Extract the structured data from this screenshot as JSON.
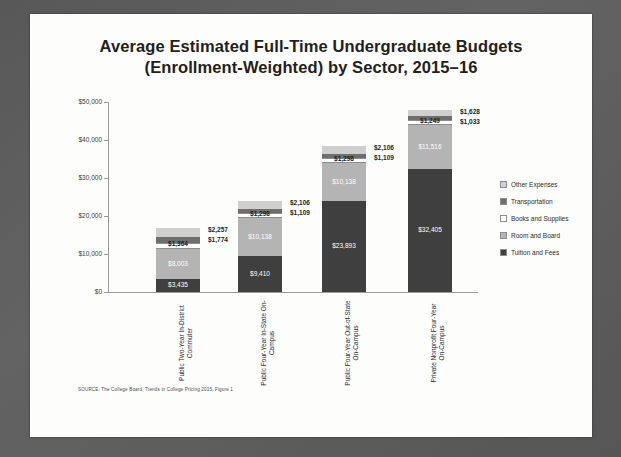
{
  "slide": {
    "title_line1": "Average Estimated Full-Time Undergraduate Budgets",
    "title_line2": "(Enrollment-Weighted) by Sector, 2015–16",
    "source_note": "SOURCE: The College Board, Trends in College Pricing 2015, Figure 1"
  },
  "colors": {
    "tuition": "#3f3f3f",
    "room": "#b4b4b4",
    "books": "#ffffff",
    "transportation": "#6e6e6e",
    "other": "#cfcfcf",
    "slide_background": "#fdfdfb",
    "frame": "#5b5b5b"
  },
  "chart_data": {
    "type": "bar",
    "stacked": true,
    "title": "Average Estimated Full-Time Undergraduate Budgets (Enrollment-Weighted) by Sector, 2015–16",
    "xlabel": "",
    "ylabel": "",
    "ylim": [
      0,
      50000
    ],
    "yticks": [
      0,
      10000,
      20000,
      30000,
      40000,
      50000
    ],
    "ytick_labels": [
      "$0",
      "$10,000",
      "$20,000",
      "$30,000",
      "$40,000",
      "$50,000"
    ],
    "grid": false,
    "legend_position": "right",
    "categories": [
      "Public Two-Year In-District Commuter",
      "Public Four-Year In-State On-Campus",
      "Public Four-Year Out-of-State On-Campus",
      "Private Nonprofit Four-Year On-Campus"
    ],
    "series": [
      {
        "name": "Tuition and Fees",
        "values": [
          3435,
          9410,
          23893,
          32405
        ],
        "labels": [
          "$3,435",
          "$9,410",
          "$23,893",
          "$32,405"
        ]
      },
      {
        "name": "Room and Board",
        "values": [
          8003,
          10138,
          10138,
          11516
        ],
        "labels": [
          "$8,003",
          "$10,138",
          "$10,138",
          "$11,516"
        ]
      },
      {
        "name": "Books and Supplies",
        "values": [
          1364,
          1298,
          1298,
          1249
        ],
        "labels": [
          "$1,364",
          "$1,298",
          "$1,298",
          "$1,249"
        ]
      },
      {
        "name": "Transportation",
        "values": [
          1774,
          1109,
          1109,
          1033
        ],
        "labels": [
          "$1,774",
          "$1,109",
          "$1,109",
          "$1,033"
        ]
      },
      {
        "name": "Other Expenses",
        "values": [
          2257,
          2106,
          2106,
          1628
        ],
        "labels": [
          "$2,257",
          "$2,106",
          "$2,106",
          "$1,628"
        ]
      }
    ],
    "totals": [
      16833,
      24061,
      38544,
      47831
    ]
  },
  "legend": {
    "items": [
      {
        "label": "Other Expenses"
      },
      {
        "label": "Transportation"
      },
      {
        "label": "Books and Supplies"
      },
      {
        "label": "Room and Board"
      },
      {
        "label": "Tuition and Fees"
      }
    ]
  }
}
